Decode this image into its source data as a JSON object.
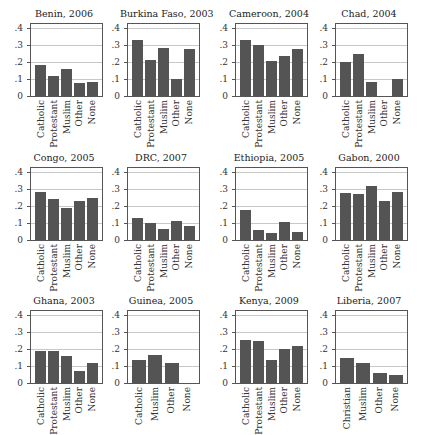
{
  "chart_data": [
    {
      "type": "bar",
      "title": "Benin, 2006",
      "categories": [
        "Catholic",
        "Protestant",
        "Muslim",
        "Other",
        "None"
      ],
      "values": [
        0.18,
        0.115,
        0.16,
        0.075,
        0.08
      ],
      "ylim": [
        0,
        0.4
      ],
      "yticks": [
        "0",
        ".1",
        ".2",
        ".3",
        ".4"
      ],
      "grid": true
    },
    {
      "type": "bar",
      "title": "Burkina Faso, 2003",
      "categories": [
        "Catholic",
        "Protestant",
        "Muslim",
        "Other",
        "None"
      ],
      "values": [
        0.33,
        0.21,
        0.285,
        0.1,
        0.275
      ],
      "ylim": [
        0,
        0.4
      ],
      "yticks": [
        "0",
        ".1",
        ".2",
        ".3",
        ".4"
      ],
      "grid": true
    },
    {
      "type": "bar",
      "title": "Cameroon, 2004",
      "categories": [
        "Catholic",
        "Protestant",
        "Muslim",
        "Other",
        "None"
      ],
      "values": [
        0.33,
        0.3,
        0.205,
        0.235,
        0.275
      ],
      "ylim": [
        0,
        0.4
      ],
      "yticks": [
        "0",
        ".1",
        ".2",
        ".3",
        ".4"
      ],
      "grid": true
    },
    {
      "type": "bar",
      "title": "Chad, 2004",
      "categories": [
        "Catholic",
        "Protestant",
        "Muslim",
        "Other",
        "None"
      ],
      "values": [
        0.2,
        0.25,
        0.08,
        0,
        0.1
      ],
      "ylim": [
        0,
        0.4
      ],
      "yticks": [
        "0",
        ".1",
        ".2",
        ".3",
        ".4"
      ],
      "grid": true
    },
    {
      "type": "bar",
      "title": "Congo, 2005",
      "categories": [
        "Catholic",
        "Protestant",
        "Muslim",
        "Other",
        "None"
      ],
      "values": [
        0.28,
        0.24,
        0.19,
        0.23,
        0.25
      ],
      "ylim": [
        0,
        0.4
      ],
      "yticks": [
        "0",
        ".1",
        ".2",
        ".3",
        ".4"
      ],
      "grid": true
    },
    {
      "type": "bar",
      "title": "DRC, 2007",
      "categories": [
        "Catholic",
        "Protestant",
        "Muslim",
        "Other",
        "None"
      ],
      "values": [
        0.13,
        0.1,
        0.065,
        0.11,
        0.08
      ],
      "ylim": [
        0,
        0.4
      ],
      "yticks": [
        "0",
        ".1",
        ".2",
        ".3",
        ".4"
      ],
      "grid": true
    },
    {
      "type": "bar",
      "title": "Ethiopia, 2005",
      "categories": [
        "Catholic",
        "Protestant",
        "Muslim",
        "Other",
        "None"
      ],
      "values": [
        0.175,
        0.06,
        0.04,
        0.105,
        0.045
      ],
      "ylim": [
        0,
        0.4
      ],
      "yticks": [
        "0",
        ".1",
        ".2",
        ".3",
        ".4"
      ],
      "grid": true
    },
    {
      "type": "bar",
      "title": "Gabon, 2000",
      "categories": [
        "Catholic",
        "Protestant",
        "Muslim",
        "Other",
        "None"
      ],
      "values": [
        0.275,
        0.27,
        0.32,
        0.23,
        0.28
      ],
      "ylim": [
        0,
        0.4
      ],
      "yticks": [
        "0",
        ".1",
        ".2",
        ".3",
        ".4"
      ],
      "grid": true
    },
    {
      "type": "bar",
      "title": "Ghana, 2003",
      "categories": [
        "Catholic",
        "Protestant",
        "Muslim",
        "Other",
        "None"
      ],
      "values": [
        0.19,
        0.19,
        0.16,
        0.07,
        0.115
      ],
      "ylim": [
        0,
        0.4
      ],
      "yticks": [
        "0",
        ".1",
        ".2",
        ".3",
        ".4"
      ],
      "grid": true
    },
    {
      "type": "bar",
      "title": "Guinea, 2005",
      "categories": [
        "Catholic",
        "Muslim",
        "Other",
        "None"
      ],
      "values": [
        0.135,
        0.165,
        0.12,
        0
      ],
      "ylim": [
        0,
        0.4
      ],
      "yticks": [
        "0",
        ".1",
        ".2",
        ".3",
        ".4"
      ],
      "grid": true
    },
    {
      "type": "bar",
      "title": "Kenya, 2009",
      "categories": [
        "Catholic",
        "Protestant",
        "Muslim",
        "Other",
        "None"
      ],
      "values": [
        0.255,
        0.245,
        0.135,
        0.2,
        0.22
      ],
      "ylim": [
        0,
        0.4
      ],
      "yticks": [
        "0",
        ".1",
        ".2",
        ".3",
        ".4"
      ],
      "grid": true
    },
    {
      "type": "bar",
      "title": "Liberia, 2007",
      "categories": [
        "Christian",
        "Muslim",
        "Other",
        "None"
      ],
      "values": [
        0.145,
        0.115,
        0.06,
        0.045
      ],
      "ylim": [
        0,
        0.4
      ],
      "yticks": [
        "0",
        ".1",
        ".2",
        ".3",
        ".4"
      ],
      "grid": true
    }
  ],
  "layout": {
    "columns": 4,
    "rows": 3,
    "bar_color": "#545454",
    "grid_color": "#c8c8c8",
    "axis_color": "#555555"
  }
}
